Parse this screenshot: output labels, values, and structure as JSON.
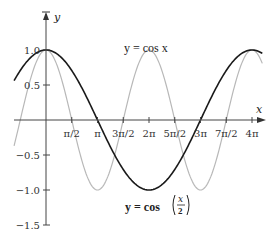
{
  "chart_data": {
    "type": "line",
    "title": "",
    "xlabel": "x",
    "ylabel": "y",
    "xlim": [
      -0.62,
      4.2
    ],
    "xlim_units": "multiples of pi",
    "ylim": [
      -1.5,
      1.1
    ],
    "grid": false,
    "x_ticks": [
      {
        "value": 0.5,
        "label": "π/2"
      },
      {
        "value": 1.0,
        "label": "π"
      },
      {
        "value": 1.5,
        "label": "3π/2"
      },
      {
        "value": 2.0,
        "label": "2π"
      },
      {
        "value": 2.5,
        "label": "5π/2"
      },
      {
        "value": 3.0,
        "label": "3π"
      },
      {
        "value": 3.5,
        "label": "7π/2"
      },
      {
        "value": 4.0,
        "label": "4π"
      }
    ],
    "y_ticks": [
      {
        "value": 1.0,
        "label": "1.0"
      },
      {
        "value": 0.5,
        "label": "0.5"
      },
      {
        "value": -0.5,
        "label": "−0.5"
      },
      {
        "value": -1.0,
        "label": "−1.0"
      },
      {
        "value": -1.5,
        "label": "−1.5"
      }
    ],
    "series": [
      {
        "name": "y = cos x",
        "color": "#b8b8b8",
        "function": "cos(x)",
        "x_pi": [
          0,
          0.5,
          1,
          1.5,
          2,
          2.5,
          3,
          3.5,
          4
        ],
        "values": [
          1,
          0,
          -1,
          0,
          1,
          0,
          -1,
          0,
          1
        ]
      },
      {
        "name": "y = cos(x/2)",
        "color": "#1a1a1a",
        "function": "cos(x/2)",
        "x_pi": [
          0,
          0.5,
          1,
          1.5,
          2,
          2.5,
          3,
          3.5,
          4
        ],
        "values": [
          1,
          0.707,
          0,
          -0.707,
          -1,
          -0.707,
          0,
          0.707,
          1
        ]
      }
    ],
    "annotations": [
      {
        "text": "y = cos x",
        "x_pi": 2.05,
        "y": 1.05
      },
      {
        "text": "y = cos(x/2)",
        "x_pi": 1.85,
        "y": -1.3
      }
    ],
    "legend": "none"
  },
  "labels": {
    "y_axis": "y",
    "x_axis": "x",
    "cos_x": "y = cos x",
    "cos_half_prefix": "y = cos",
    "cos_half_num": "x",
    "cos_half_den": "2"
  }
}
